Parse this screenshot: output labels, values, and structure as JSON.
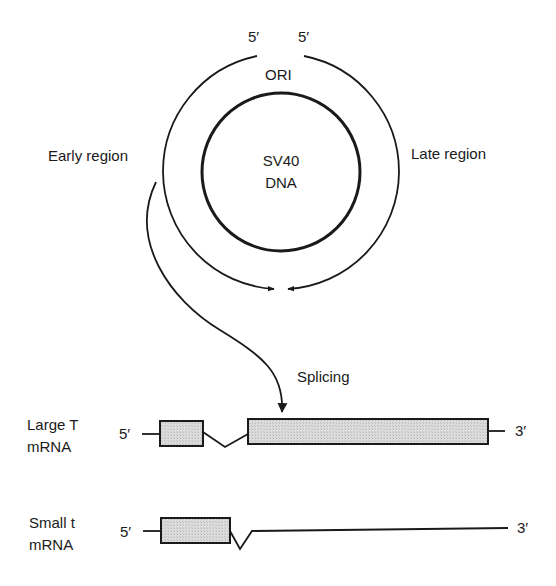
{
  "diagram": {
    "type": "SV40 genome transcription and splicing diagram",
    "circle": {
      "center_label_line1": "SV40",
      "center_label_line2": "DNA",
      "ori_label": "ORI",
      "five_prime_left": "5′",
      "five_prime_right": "5′",
      "early_region_label": "Early region",
      "late_region_label": "Late region"
    },
    "splicing_label": "Splicing",
    "transcripts": [
      {
        "name_line1": "Large T",
        "name_line2": "mRNA",
        "five_prime": "5′",
        "three_prime": "3′"
      },
      {
        "name_line1": "Small t",
        "name_line2": "mRNA",
        "five_prime": "5′",
        "three_prime": "3′"
      }
    ],
    "colors": {
      "stroke": "#1a1a1a",
      "exon_fill": "#d6d6d6",
      "background": "#ffffff"
    }
  }
}
